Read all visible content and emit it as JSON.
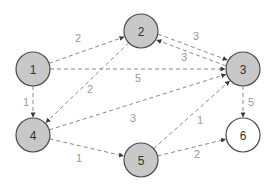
{
  "diagram": {
    "type": "directed-weighted-graph",
    "colors": {
      "visited_fill": "#c8c8c8",
      "unvisited_fill": "#ffffff",
      "node_stroke": "#4a4a4a",
      "edge": "#8a8a8a",
      "edge_label": "#9a9a9a"
    },
    "nodes": [
      {
        "id": "1",
        "label": "1",
        "x": 33,
        "y": 69,
        "filled": true
      },
      {
        "id": "2",
        "label": "2",
        "x": 141,
        "y": 31,
        "filled": true
      },
      {
        "id": "3",
        "label": "3",
        "x": 243,
        "y": 69,
        "filled": true
      },
      {
        "id": "4",
        "label": "4",
        "x": 33,
        "y": 135,
        "filled": true
      },
      {
        "id": "5",
        "label": "5",
        "x": 141,
        "y": 160,
        "filled": true
      },
      {
        "id": "6",
        "label": "6",
        "x": 243,
        "y": 135,
        "filled": false
      }
    ],
    "edges": [
      {
        "from": "1",
        "to": "2",
        "weight": "2",
        "lx": 78,
        "ly": 38
      },
      {
        "from": "1",
        "to": "3",
        "weight": "5",
        "lx": 138,
        "ly": 78
      },
      {
        "from": "1",
        "to": "4",
        "weight": "1",
        "lx": 26,
        "ly": 102
      },
      {
        "from": "2",
        "to": "4",
        "weight": "2",
        "lx": 90,
        "ly": 89
      },
      {
        "from": "2",
        "to": "3",
        "weight": "3",
        "lx": 196,
        "ly": 36,
        "offset": -3
      },
      {
        "from": "3",
        "to": "2",
        "weight": "3",
        "lx": 184,
        "ly": 57,
        "offset": -3
      },
      {
        "from": "4",
        "to": "3",
        "weight": "3",
        "lx": 133,
        "ly": 118
      },
      {
        "from": "4",
        "to": "5",
        "weight": "1",
        "lx": 79,
        "ly": 158
      },
      {
        "from": "5",
        "to": "3",
        "weight": "1",
        "lx": 200,
        "ly": 120
      },
      {
        "from": "5",
        "to": "6",
        "weight": "2",
        "lx": 197,
        "ly": 154
      },
      {
        "from": "3",
        "to": "6",
        "weight": "5",
        "lx": 251,
        "ly": 102
      }
    ]
  }
}
